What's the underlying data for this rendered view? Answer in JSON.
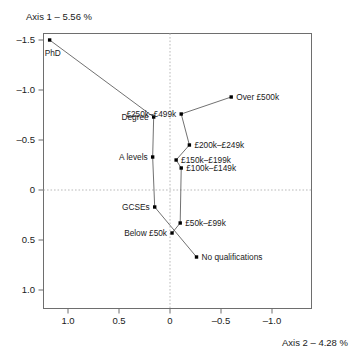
{
  "chart_data": {
    "type": "scatter",
    "title": "",
    "xlabel": "Axis 2 – 4.28 %",
    "ylabel": "Axis 1 – 5.56 %",
    "xlim": [
      1.25,
      -1.25
    ],
    "ylim": [
      -1.75,
      1.25
    ],
    "x_reversed": true,
    "y_reversed": true,
    "grid": false,
    "zero_lines": true,
    "legend": "none",
    "xticks": [
      1.0,
      0.5,
      0,
      -0.5,
      -1.0
    ],
    "xtick_labels": [
      "1.0",
      "0.5",
      "0",
      "–0.5",
      "–1.0"
    ],
    "yticks": [
      -1.5,
      -1.0,
      -0.5,
      0,
      0.5,
      1.0
    ],
    "ytick_labels": [
      "–1.5",
      "–1.0",
      "–0.5",
      "0",
      "0.5",
      "1.0"
    ],
    "series": [
      {
        "name": "Highest qualification",
        "connected": true,
        "points": [
          {
            "label": "PhD",
            "x": 1.18,
            "y": -1.5,
            "label_pos": "below-left"
          },
          {
            "label": "Degree",
            "x": 0.16,
            "y": -0.73,
            "label_pos": "left"
          },
          {
            "label": "A levels",
            "x": 0.17,
            "y": -0.33,
            "label_pos": "left"
          },
          {
            "label": "GCSEs",
            "x": 0.15,
            "y": 0.17,
            "label_pos": "left"
          },
          {
            "label": "No qualifications",
            "x": -0.26,
            "y": 0.67,
            "label_pos": "right"
          }
        ]
      },
      {
        "name": "Income band",
        "connected": true,
        "points": [
          {
            "label": "Over £500k",
            "x": -0.6,
            "y": -0.93,
            "label_pos": "right"
          },
          {
            "label": "£250k–£499k",
            "x": -0.11,
            "y": -0.76,
            "label_pos": "left"
          },
          {
            "label": "£200k–£249k",
            "x": -0.19,
            "y": -0.45,
            "label_pos": "right"
          },
          {
            "label": "£150k–£199k",
            "x": -0.06,
            "y": -0.3,
            "label_pos": "right"
          },
          {
            "label": "£100k–£149k",
            "x": -0.11,
            "y": -0.22,
            "label_pos": "right"
          },
          {
            "label": "£50k–£99k",
            "x": -0.1,
            "y": 0.33,
            "label_pos": "right"
          },
          {
            "label": "Below £50k",
            "x": -0.02,
            "y": 0.43,
            "label_pos": "left"
          }
        ]
      }
    ]
  },
  "axes": {
    "y_axis_title": "Axis 1 – 5.56 %",
    "x_axis_title": "Axis 2 – 4.28 %"
  },
  "tick_labels": {
    "y": [
      "–1.5",
      "–1.0",
      "–0.5",
      "0",
      "0.5",
      "1.0"
    ],
    "x": [
      "1.0",
      "0.5",
      "0",
      "–0.5",
      "–1.0"
    ]
  },
  "point_labels": {
    "phd": "PhD",
    "degree": "Degree",
    "a_levels": "A levels",
    "gcses": "GCSEs",
    "no_qualifications": "No qualifications",
    "over_500k": "Over £500k",
    "b250_499": "£250k–£499k",
    "b200_249": "£200k–£249k",
    "b150_199": "£150k–£199k",
    "b100_149": "£100k–£149k",
    "b50_99": "£50k–£99k",
    "below_50k": "Below £50k"
  },
  "colors": {
    "point": "#000000",
    "line": "#4d4d4d",
    "frame": "#6e6e6e",
    "zero": "#b9b9b9",
    "text": "#1a1a1a",
    "background": "#ffffff"
  }
}
